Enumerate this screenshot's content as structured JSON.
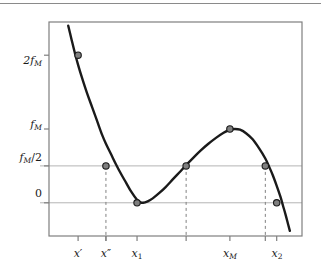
{
  "figure": {
    "background_color": "#ffffff",
    "frame_color": "#7f7f7f",
    "curve_color": "#1a1a1a",
    "marker_face_color": "#7f7f7f",
    "marker_edge_color": "#1a1a1a",
    "gridline_color": "#b4b4b4",
    "dashed_line_color": "#808080",
    "top_rule": true
  },
  "chart_data": {
    "type": "line",
    "title": "",
    "xlabel": "",
    "ylabel": "",
    "grid": "horizontal-only",
    "legend": "none",
    "xlim": [
      0.0,
      1.0
    ],
    "ylim": [
      -0.45,
      2.45
    ],
    "y_ticks": [
      {
        "label": "2f_M",
        "value": 2.0,
        "display": "2",
        "sub": "M",
        "base": "f"
      },
      {
        "label": "f_M",
        "value": 1.0,
        "display": "",
        "sub": "M",
        "base": "f"
      },
      {
        "label": "f_M/2",
        "value": 0.5,
        "display": "",
        "sub": "M",
        "base": "f"
      },
      {
        "label": "0",
        "value": 0.0,
        "display": "0",
        "sub": "",
        "base": ""
      }
    ],
    "x_ticks": [
      {
        "label": "x'",
        "value": 0.115,
        "base": "x",
        "prime": "′",
        "sub": ""
      },
      {
        "label": "x''",
        "value": 0.225,
        "base": "x",
        "prime": "′′",
        "sub": ""
      },
      {
        "label": "x_1",
        "value": 0.348,
        "base": "x",
        "prime": "",
        "sub": "1"
      },
      {
        "label": "x_M",
        "value": 0.715,
        "base": "x",
        "prime": "",
        "sub": "M"
      },
      {
        "label": "x_2",
        "value": 0.9,
        "base": "x",
        "prime": "",
        "sub": "2"
      }
    ],
    "gridlines_y": [
      0.5,
      0.0
    ],
    "dashed_verticals": [
      {
        "x": 0.225,
        "from_y": 0.5,
        "to_y": -0.45
      },
      {
        "x": 0.542,
        "from_y": 0.5,
        "to_y": -0.45
      },
      {
        "x": 0.855,
        "from_y": 0.5,
        "to_y": -0.45
      }
    ],
    "curve_points": [
      [
        0.076,
        2.4
      ],
      [
        0.09,
        2.2
      ],
      [
        0.103,
        2.02
      ],
      [
        0.115,
        1.87
      ],
      [
        0.13,
        1.7
      ],
      [
        0.15,
        1.49
      ],
      [
        0.17,
        1.3
      ],
      [
        0.19,
        1.11
      ],
      [
        0.21,
        0.92
      ],
      [
        0.225,
        0.8
      ],
      [
        0.245,
        0.66
      ],
      [
        0.265,
        0.52
      ],
      [
        0.285,
        0.39
      ],
      [
        0.305,
        0.27
      ],
      [
        0.325,
        0.15
      ],
      [
        0.348,
        0.04
      ],
      [
        0.36,
        0.01
      ],
      [
        0.372,
        0.0
      ],
      [
        0.39,
        0.02
      ],
      [
        0.41,
        0.06
      ],
      [
        0.435,
        0.13
      ],
      [
        0.46,
        0.21
      ],
      [
        0.49,
        0.32
      ],
      [
        0.515,
        0.41
      ],
      [
        0.542,
        0.51
      ],
      [
        0.57,
        0.61
      ],
      [
        0.6,
        0.71
      ],
      [
        0.63,
        0.8
      ],
      [
        0.66,
        0.88
      ],
      [
        0.69,
        0.95
      ],
      [
        0.715,
        0.99
      ],
      [
        0.735,
        1.0
      ],
      [
        0.755,
        0.99
      ],
      [
        0.78,
        0.94
      ],
      [
        0.805,
        0.86
      ],
      [
        0.83,
        0.74
      ],
      [
        0.855,
        0.6
      ],
      [
        0.87,
        0.49
      ],
      [
        0.885,
        0.37
      ],
      [
        0.9,
        0.23
      ],
      [
        0.915,
        0.08
      ],
      [
        0.925,
        -0.04
      ],
      [
        0.935,
        -0.16
      ],
      [
        0.945,
        -0.29
      ],
      [
        0.952,
        -0.38
      ]
    ],
    "markers": [
      {
        "name": "marker-x-prime",
        "x": 0.115,
        "y": 2.0,
        "label": "2f_M"
      },
      {
        "name": "marker-x-doubleprime",
        "x": 0.225,
        "y": 0.5,
        "label": "f_M/2"
      },
      {
        "name": "marker-x1-minimum",
        "x": 0.348,
        "y": 0.0,
        "label": "0"
      },
      {
        "name": "marker-mid-half",
        "x": 0.542,
        "y": 0.5,
        "label": "f_M/2"
      },
      {
        "name": "marker-xM-maximum",
        "x": 0.715,
        "y": 1.0,
        "label": "f_M"
      },
      {
        "name": "marker-right-half",
        "x": 0.855,
        "y": 0.5,
        "label": "f_M/2"
      },
      {
        "name": "marker-x2-zero",
        "x": 0.9,
        "y": 0.0,
        "label": "0"
      }
    ]
  }
}
